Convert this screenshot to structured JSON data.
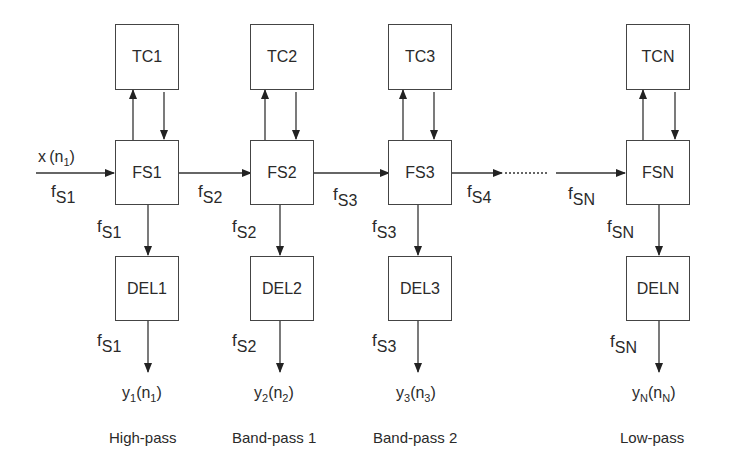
{
  "diagram": {
    "type": "filter-bank-block-diagram",
    "input": {
      "signal": "x",
      "index": "n",
      "index_sub": "1",
      "rate": "f",
      "rate_sub": "S1"
    },
    "stages": [
      {
        "tc": "TC1",
        "fs": "FS1",
        "del": "DEL1",
        "out_rate_label": {
          "f": "f",
          "sub": "S2"
        },
        "down_rate_label": {
          "f": "f",
          "sub": "S1"
        },
        "del_rate_label": {
          "f": "f",
          "sub": "S1"
        },
        "output": {
          "y": "y",
          "y_sub": "1",
          "n": "n",
          "n_sub": "1"
        },
        "caption": "High-pass"
      },
      {
        "tc": "TC2",
        "fs": "FS2",
        "del": "DEL2",
        "out_rate_label": {
          "f": "f",
          "sub": "S3"
        },
        "down_rate_label": {
          "f": "f",
          "sub": "S2"
        },
        "del_rate_label": {
          "f": "f",
          "sub": "S2"
        },
        "output": {
          "y": "y",
          "y_sub": "2",
          "n": "n",
          "n_sub": "2"
        },
        "caption": "Band-pass 1"
      },
      {
        "tc": "TC3",
        "fs": "FS3",
        "del": "DEL3",
        "out_rate_label": {
          "f": "f",
          "sub": "S4"
        },
        "down_rate_label": {
          "f": "f",
          "sub": "S3"
        },
        "del_rate_label": {
          "f": "f",
          "sub": "S3"
        },
        "output": {
          "y": "y",
          "y_sub": "3",
          "n": "n",
          "n_sub": "3"
        },
        "caption": "Band-pass 2"
      },
      {
        "tc": "TCN",
        "fs": "FSN",
        "del": "DELN",
        "in_rate_label": {
          "f": "f",
          "sub": "SN"
        },
        "down_rate_label": {
          "f": "f",
          "sub": "SN"
        },
        "del_rate_label": {
          "f": "f",
          "sub": "SN"
        },
        "output": {
          "y": "y",
          "y_sub": "N",
          "n": "n",
          "n_sub": "N"
        },
        "caption": "Low-pass"
      }
    ],
    "colors": {
      "line": "#333333",
      "text": "#2a2a2a",
      "background": "#ffffff"
    }
  }
}
